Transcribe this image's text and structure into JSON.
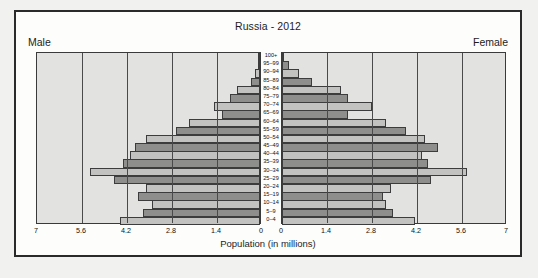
{
  "chart_data": {
    "type": "bar",
    "subtype": "population-pyramid",
    "title": "Russia - 2012",
    "xlabel": "Population (in millions)",
    "ylabel": "",
    "left_label": "Male",
    "right_label": "Female",
    "grid": true,
    "legend_position": "none",
    "xlim": [
      0,
      7
    ],
    "xticks": [
      7,
      5.6,
      4.2,
      2.8,
      1.4,
      0
    ],
    "xticks_right": [
      0,
      1.4,
      2.8,
      4.2,
      5.6,
      7
    ],
    "categories": [
      "100+",
      "95–99",
      "90–94",
      "85–89",
      "80–84",
      "75–79",
      "70–74",
      "65–69",
      "60–64",
      "55–59",
      "50–54",
      "45–49",
      "40–44",
      "35–39",
      "30–34",
      "25–29",
      "20–24",
      "15–19",
      "10–14",
      "5–9",
      "0–4"
    ],
    "series": [
      {
        "name": "Male",
        "side": "left",
        "values": [
          0.01,
          0.06,
          0.15,
          0.29,
          0.72,
          0.92,
          1.42,
          1.17,
          2.2,
          2.6,
          3.55,
          3.9,
          4.05,
          4.25,
          5.3,
          4.55,
          3.55,
          3.8,
          3.35,
          3.65,
          4.35
        ]
      },
      {
        "name": "Female",
        "side": "right",
        "values": [
          0.03,
          0.22,
          0.53,
          0.92,
          1.82,
          2.05,
          2.8,
          2.05,
          3.25,
          3.85,
          4.45,
          4.85,
          4.35,
          4.55,
          5.75,
          4.65,
          3.4,
          3.15,
          3.25,
          3.45,
          4.15
        ]
      }
    ]
  },
  "figure": {
    "background": "#f1f1f0",
    "panel_background": "#e2e2e0",
    "bar_dark": "#8e8e8c",
    "bar_light": "#c2c2c0",
    "bar_edge": "#3c3c3c",
    "frame_color": "#2a2a2a"
  }
}
